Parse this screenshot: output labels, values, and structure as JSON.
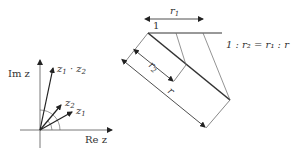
{
  "left_diagram": {
    "axis_y_label": "Im z",
    "axis_x_label": "Re z",
    "vectors": [
      {
        "name": "z1",
        "label": "z",
        "sub": "1"
      },
      {
        "name": "z2",
        "label": "z",
        "sub": "2"
      },
      {
        "name": "product",
        "label": "z",
        "sub": "1",
        "op": " · ",
        "label2": "z",
        "sub2": "2"
      }
    ]
  },
  "right_diagram": {
    "label_one": "1",
    "label_r1": "r",
    "label_r1_sub": "1",
    "label_r2": "r",
    "label_r2_sub": "2",
    "label_r": "r",
    "ratio_text": "1 : r₂ = r₁ : r"
  }
}
